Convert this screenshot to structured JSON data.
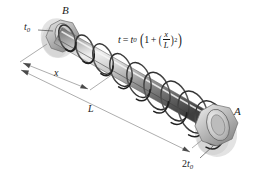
{
  "figure": {
    "background_color": "#ffffff",
    "width": 257,
    "height": 180
  },
  "labels": {
    "end_b": "B",
    "end_a": "A",
    "thickness_start": "t",
    "thickness_start_sub": "0",
    "thickness_end_coeff": "2",
    "thickness_end": "t",
    "thickness_end_sub": "0",
    "dimension_x": "x",
    "dimension_l": "L"
  },
  "formula": {
    "lhs": "t",
    "equals": "=",
    "coefficient": "t",
    "coefficient_sub": "0",
    "one": "1",
    "plus": "+",
    "numerator": "x",
    "denominator": "L",
    "exponent": "2",
    "plain_text": "t = t0(1 + (x/L)^2)"
  },
  "geometry": {
    "coil_turns": 9,
    "axis_start": [
      56,
      40
    ],
    "axis_end": [
      216,
      131
    ]
  },
  "colors": {
    "shaft_light": "#f2f2f2",
    "shaft_mid": "#9a9a9a",
    "shaft_dark": "#4e4e4e",
    "coil_stroke": "#3a3a3a",
    "nut_fill": "#bdbdbd",
    "shadow": "#d6d6d6",
    "dimension_line": "#7e7e7e",
    "text": "#141414"
  }
}
